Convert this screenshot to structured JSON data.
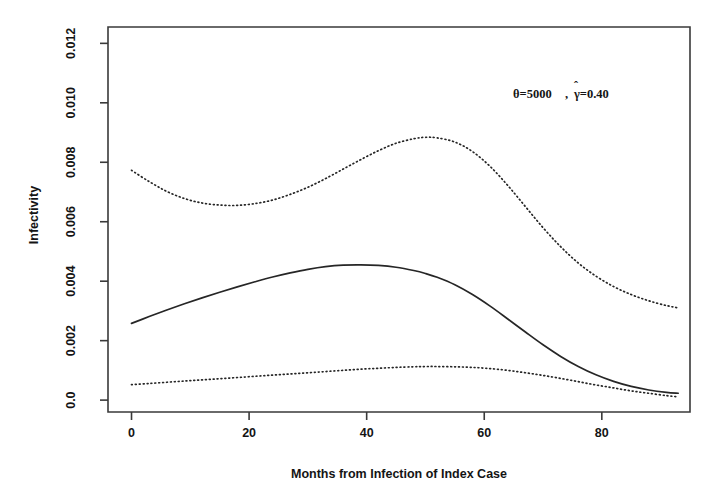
{
  "chart_data": {
    "type": "line",
    "title": "",
    "xlabel": "Months from Infection of Index Case",
    "ylabel": "Infectivity",
    "xlim": [
      -4,
      95
    ],
    "ylim": [
      -0.0004,
      0.01255
    ],
    "xticks": [
      0,
      20,
      40,
      60,
      80
    ],
    "xticklabels": [
      "0",
      "20",
      "40",
      "60",
      "80"
    ],
    "yticks": [
      0.0,
      0.002,
      0.004,
      0.006,
      0.008,
      0.01,
      0.012
    ],
    "yticklabels": [
      "0.0",
      "0.002",
      "0.004",
      "0.006",
      "0.008",
      "0.010",
      "0.012"
    ],
    "grid": false,
    "legend": "none",
    "annotations": [
      {
        "name": "parameter-annotation",
        "text": "θ=5000 , γ̂=0.40",
        "theta_label": "θ=5000",
        "separator": " , ",
        "gamma_label": "γ=0.40",
        "gamma_hat": "̂",
        "x": 50,
        "y": 0.0107
      }
    ],
    "series": [
      {
        "name": "upper confidence bound",
        "style": "dotted",
        "color": "#262626",
        "x": [
          0,
          3,
          6,
          9,
          12,
          15,
          18,
          21,
          24,
          27,
          30,
          33,
          36,
          39,
          42,
          45,
          48,
          50,
          52,
          55,
          58,
          61,
          64,
          67,
          70,
          73,
          76,
          79,
          82,
          85,
          88,
          91,
          93
        ],
        "y": [
          0.00773,
          0.00735,
          0.00702,
          0.00678,
          0.00663,
          0.00656,
          0.00655,
          0.00661,
          0.00673,
          0.00692,
          0.00716,
          0.00745,
          0.00777,
          0.00809,
          0.00839,
          0.00864,
          0.00879,
          0.00884,
          0.00882,
          0.00868,
          0.00836,
          0.00786,
          0.00722,
          0.00651,
          0.0058,
          0.00516,
          0.00461,
          0.00417,
          0.00382,
          0.00355,
          0.00334,
          0.00318,
          0.0031
        ]
      },
      {
        "name": "fitted infectivity curve",
        "style": "solid",
        "color": "#262626",
        "x": [
          0,
          3,
          6,
          9,
          12,
          15,
          18,
          21,
          24,
          27,
          30,
          33,
          36,
          39,
          42,
          45,
          48,
          50,
          52,
          55,
          58,
          61,
          64,
          67,
          70,
          73,
          76,
          79,
          82,
          85,
          88,
          91,
          93
        ],
        "y": [
          0.00258,
          0.00281,
          0.00303,
          0.00324,
          0.00344,
          0.00363,
          0.00381,
          0.00398,
          0.00414,
          0.00428,
          0.0044,
          0.00449,
          0.00454,
          0.00455,
          0.00453,
          0.00447,
          0.00436,
          0.00426,
          0.00413,
          0.00388,
          0.00355,
          0.00316,
          0.00273,
          0.00229,
          0.00186,
          0.00147,
          0.00113,
          0.00085,
          0.00063,
          0.00046,
          0.00034,
          0.00026,
          0.00023
        ]
      },
      {
        "name": "lower confidence bound",
        "style": "dotted",
        "color": "#262626",
        "x": [
          0,
          3,
          6,
          9,
          12,
          15,
          18,
          21,
          24,
          27,
          30,
          33,
          36,
          39,
          42,
          45,
          48,
          50,
          52,
          55,
          58,
          61,
          64,
          67,
          70,
          73,
          76,
          79,
          82,
          85,
          88,
          91,
          93
        ],
        "y": [
          0.00052,
          0.00056,
          0.0006,
          0.00064,
          0.00068,
          0.00072,
          0.00076,
          0.0008,
          0.00084,
          0.00088,
          0.00092,
          0.00096,
          0.001,
          0.00104,
          0.00107,
          0.0011,
          0.00112,
          0.00113,
          0.00113,
          0.00112,
          0.0011,
          0.00106,
          0.001,
          0.00092,
          0.00083,
          0.00073,
          0.00062,
          0.00051,
          0.00041,
          0.00031,
          0.00023,
          0.00015,
          0.00011
        ]
      }
    ]
  }
}
